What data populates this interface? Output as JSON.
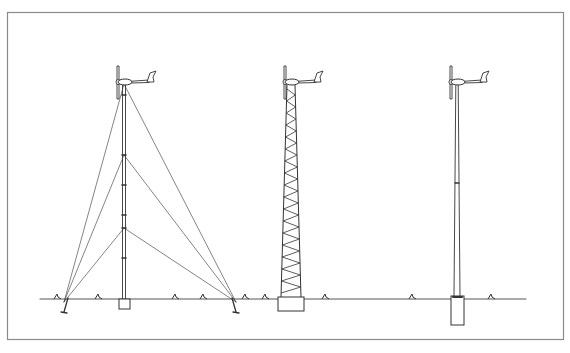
{
  "diagram": {
    "type": "technical-line-drawing",
    "frame": {
      "x": 7,
      "y": 12,
      "width": 556,
      "height": 327,
      "stroke": "#8a8a8a"
    },
    "ground": {
      "y": 299,
      "x_start": 40,
      "x_end": 526,
      "stroke": "#555555"
    },
    "line_color": "#333333",
    "towers": [
      {
        "id": "guyed",
        "label": "guyed-tower",
        "x": 124,
        "top_y": 82,
        "guy_anchor_levels_y": [
          84,
          155,
          228
        ],
        "guy_anchors": [
          [
            64,
            312
          ],
          [
            236,
            312
          ]
        ],
        "foundation": {
          "x": 119,
          "y": 299,
          "w": 11,
          "h": 10
        }
      },
      {
        "id": "lattice",
        "label": "lattice-tower",
        "x": 291,
        "top_y": 82,
        "base_half_width": 10,
        "top_half_width": 4,
        "foundation": {
          "x": 278,
          "y": 297,
          "w": 26,
          "h": 14
        }
      },
      {
        "id": "monopole",
        "label": "monopole-tower",
        "x": 457,
        "top_y": 82,
        "foundation": {
          "x": 451,
          "y": 296,
          "w": 13,
          "h": 29
        }
      }
    ],
    "grass_tufts_x": [
      57,
      98,
      175,
      203,
      245,
      265,
      325,
      412,
      491
    ]
  }
}
